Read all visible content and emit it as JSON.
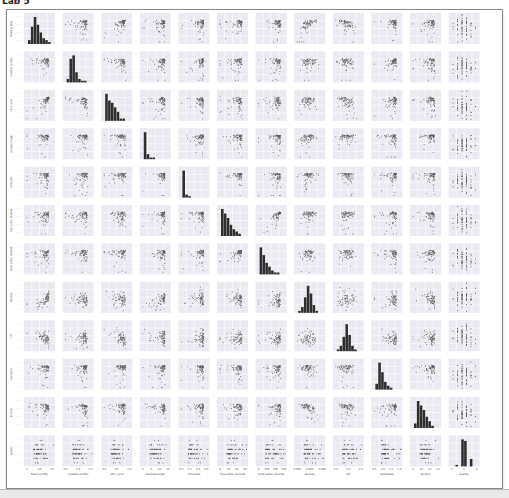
{
  "header": {
    "text": "Lab 5"
  },
  "chart_data": {
    "type": "pairplot",
    "title": "",
    "variables": [
      "fixed acidity",
      "volatile acidity",
      "citric acid",
      "residual sugar",
      "chlorides",
      "free sulfur dioxide",
      "total sulfur dioxide",
      "density",
      "pH",
      "sulphates",
      "alcohol",
      "quality"
    ],
    "x_tick_labels": [
      [
        "5",
        "10",
        "15"
      ],
      [
        "0.5",
        "1.0",
        "1.5"
      ],
      [
        "0.0",
        "0.5",
        "1.0"
      ],
      [
        "0",
        "5",
        "10",
        "15"
      ],
      [
        "0.0",
        "0.2",
        "0.4",
        "0.6"
      ],
      [
        "0",
        "20",
        "40",
        "60"
      ],
      [
        "0",
        "100",
        "200",
        "300"
      ],
      [
        "0.990",
        "0.995",
        "1.000"
      ],
      [
        "3.0",
        "3.5",
        "4.0"
      ],
      [
        "0.5",
        "1.0",
        "1.5",
        "2.0"
      ],
      [
        "8",
        "10",
        "12",
        "14"
      ],
      [
        "4",
        "6",
        "8"
      ]
    ],
    "diagonal": "histogram",
    "off_diagonal": "scatter",
    "histograms": [
      [
        2,
        9,
        14,
        10,
        6,
        3,
        2,
        1
      ],
      [
        2,
        14,
        16,
        6,
        2,
        1,
        1,
        0
      ],
      [
        12,
        9,
        8,
        6,
        4,
        1,
        1,
        0
      ],
      [
        16,
        3,
        1,
        1,
        0,
        0,
        0,
        0
      ],
      [
        18,
        2,
        1,
        0,
        0,
        0,
        0,
        0
      ],
      [
        12,
        10,
        8,
        5,
        3,
        2,
        1,
        0
      ],
      [
        14,
        10,
        6,
        4,
        2,
        1,
        1,
        0
      ],
      [
        1,
        3,
        8,
        14,
        10,
        4,
        1,
        0
      ],
      [
        1,
        3,
        8,
        15,
        9,
        3,
        1,
        0
      ],
      [
        3,
        14,
        9,
        4,
        2,
        1,
        0,
        0
      ],
      [
        2,
        12,
        10,
        8,
        5,
        3,
        1,
        0
      ],
      [
        0,
        1,
        0,
        18,
        17,
        0,
        5,
        0
      ]
    ],
    "correlation_hints": {
      "fixed acidity~citric acid": 0.67,
      "fixed acidity~density": 0.67,
      "fixed acidity~pH": -0.68,
      "free sulfur dioxide~total sulfur dioxide": 0.67,
      "volatile acidity~citric acid": -0.55,
      "density~alcohol": -0.5
    },
    "grid": true,
    "legend": "none",
    "panel_background": "#eaeaf2",
    "point_color": "#5a5a5a",
    "bar_color": "#2f2f2f"
  }
}
